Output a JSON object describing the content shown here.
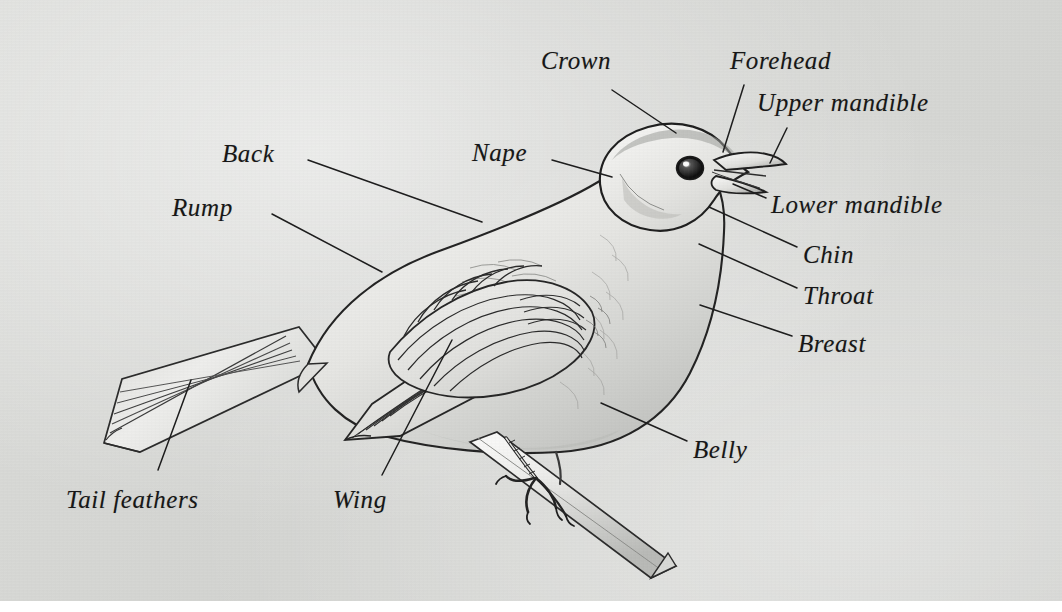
{
  "figure": {
    "medium": "pencil-and-ink-illustration",
    "background_color": "#d6d7d4",
    "ink_color": "#161616"
  },
  "labels": [
    {
      "id": "crown",
      "text": "Crown",
      "x": 541,
      "y": 48,
      "anchor_x": 612,
      "anchor_y": 90,
      "tip_x": 676,
      "tip_y": 133
    },
    {
      "id": "forehead",
      "text": "Forehead",
      "x": 730,
      "y": 48,
      "anchor_x": 744,
      "anchor_y": 85,
      "tip_x": 723,
      "tip_y": 152
    },
    {
      "id": "upper-mandible",
      "text": "Upper mandible",
      "x": 757,
      "y": 90,
      "anchor_x": 787,
      "anchor_y": 128,
      "tip_x": 770,
      "tip_y": 163
    },
    {
      "id": "nape",
      "text": "Nape",
      "x": 472,
      "y": 140,
      "anchor_x": 552,
      "anchor_y": 160,
      "tip_x": 612,
      "tip_y": 177
    },
    {
      "id": "back",
      "text": "Back",
      "x": 222,
      "y": 141,
      "anchor_x": 308,
      "anchor_y": 160,
      "tip_x": 482,
      "tip_y": 222
    },
    {
      "id": "rump",
      "text": "Rump",
      "x": 172,
      "y": 195,
      "anchor_x": 272,
      "anchor_y": 214,
      "tip_x": 382,
      "tip_y": 272
    },
    {
      "id": "lower-mandible",
      "text": "Lower mandible",
      "x": 771,
      "y": 192,
      "anchor_x": 766,
      "anchor_y": 198,
      "tip_x": 733,
      "tip_y": 184
    },
    {
      "id": "chin",
      "text": "Chin",
      "x": 803,
      "y": 242,
      "anchor_x": 797,
      "anchor_y": 247,
      "tip_x": 709,
      "tip_y": 207
    },
    {
      "id": "throat",
      "text": "Throat",
      "x": 803,
      "y": 283,
      "anchor_x": 797,
      "anchor_y": 288,
      "tip_x": 699,
      "tip_y": 244
    },
    {
      "id": "breast",
      "text": "Breast",
      "x": 798,
      "y": 331,
      "anchor_x": 792,
      "anchor_y": 336,
      "tip_x": 700,
      "tip_y": 305
    },
    {
      "id": "belly",
      "text": "Belly",
      "x": 693,
      "y": 437,
      "anchor_x": 687,
      "anchor_y": 441,
      "tip_x": 601,
      "tip_y": 403
    },
    {
      "id": "wing",
      "text": "Wing",
      "x": 333,
      "y": 487,
      "anchor_x": 382,
      "anchor_y": 475,
      "tip_x": 452,
      "tip_y": 340
    },
    {
      "id": "tail-feathers",
      "text": "Tail feathers",
      "x": 66,
      "y": 487,
      "anchor_x": 158,
      "anchor_y": 470,
      "tip_x": 191,
      "tip_y": 380
    }
  ]
}
